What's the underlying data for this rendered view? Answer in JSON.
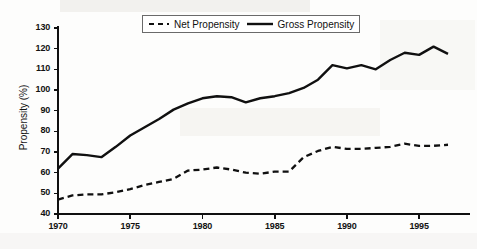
{
  "chart_data": {
    "type": "line",
    "title": "",
    "xlabel": "",
    "ylabel": "Propensity (%)",
    "xlim": [
      1970,
      1997
    ],
    "ylim": [
      40,
      130
    ],
    "ytick_labels": [
      "130",
      "120",
      "110",
      "100",
      "90",
      "80",
      "70",
      "60",
      "50",
      "40"
    ],
    "ytick_values": [
      130,
      120,
      110,
      100,
      90,
      80,
      70,
      60,
      50,
      40
    ],
    "xtick_labels": [
      "1970",
      "1975",
      "1980",
      "1985",
      "1990",
      "1995"
    ],
    "xtick_values": [
      1970,
      1975,
      1980,
      1985,
      1990,
      1995
    ],
    "grid": false,
    "legend_position": "top-center",
    "x": [
      1970,
      1971,
      1972,
      1973,
      1974,
      1975,
      1976,
      1977,
      1978,
      1979,
      1980,
      1981,
      1982,
      1983,
      1984,
      1985,
      1986,
      1987,
      1988,
      1989,
      1990,
      1991,
      1992,
      1993,
      1994,
      1995,
      1996,
      1997
    ],
    "series": [
      {
        "name": "Net Propensity",
        "style": "dashed",
        "color": "#101010",
        "values": [
          47,
          49,
          49.5,
          49.5,
          50.5,
          52,
          54,
          55.5,
          57,
          61,
          61.5,
          62.5,
          61.5,
          60,
          59.5,
          60.5,
          60.5,
          67.5,
          70.5,
          72.5,
          71.5,
          71.5,
          72,
          72.5,
          74,
          73,
          73,
          73.5
        ]
      },
      {
        "name": "Gross Propensity",
        "style": "solid",
        "color": "#101010",
        "values": [
          62,
          69,
          68.5,
          67.5,
          72.5,
          78,
          82,
          86,
          90.5,
          93.5,
          96,
          97,
          96.5,
          94,
          96,
          97,
          98.5,
          101,
          105,
          112,
          110.5,
          112,
          110,
          114.5,
          118,
          117,
          121,
          117.5
        ]
      }
    ]
  },
  "axes": {
    "y_title": "Propensity (%)"
  },
  "legend": {
    "entries": [
      {
        "label": "Net Propensity",
        "swatch": "dashed-line-swatch"
      },
      {
        "label": "Gross Propensity",
        "swatch": "solid-line-swatch"
      }
    ]
  }
}
